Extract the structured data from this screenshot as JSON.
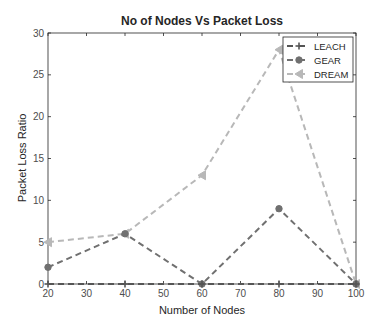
{
  "chart_data": {
    "type": "line",
    "title": "No of Nodes Vs Packet Loss",
    "xlabel": "Number of Nodes",
    "ylabel": "Packet Loss Ratio",
    "x": [
      20,
      40,
      60,
      80,
      100
    ],
    "xlim": [
      20,
      100
    ],
    "ylim": [
      0,
      30
    ],
    "xticks": [
      20,
      30,
      40,
      50,
      60,
      70,
      80,
      90,
      100
    ],
    "yticks": [
      0,
      5,
      10,
      15,
      20,
      25,
      30
    ],
    "grid": false,
    "legend_position": "upper right",
    "series": [
      {
        "name": "LEACH",
        "values": [
          0,
          0,
          0,
          0,
          0
        ],
        "color": "#555555",
        "marker": "plus",
        "linestyle": "dashed"
      },
      {
        "name": "GEAR",
        "values": [
          2,
          6,
          0,
          9,
          0
        ],
        "color": "#707070",
        "marker": "circle",
        "linestyle": "dashed"
      },
      {
        "name": "DREAM",
        "values": [
          5,
          6,
          13,
          28,
          0
        ],
        "color": "#b8b8b8",
        "marker": "triangle-left",
        "linestyle": "dashed"
      }
    ]
  }
}
